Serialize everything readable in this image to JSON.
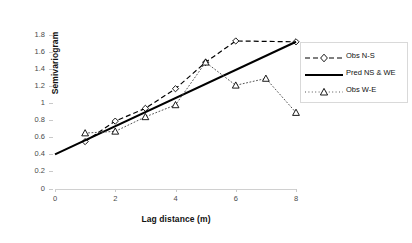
{
  "chart_data": {
    "type": "line",
    "title": "",
    "xlabel": "Lag distance (m)",
    "ylabel": "Semivariogram",
    "xlim": [
      0,
      8
    ],
    "ylim": [
      0,
      1.8
    ],
    "xticks": [
      "0",
      "2",
      "4",
      "6",
      "8"
    ],
    "xtick_values": [
      0,
      2,
      4,
      6,
      8
    ],
    "yticks": [
      "0",
      "0.2",
      "0.4",
      "0.6",
      "0.8",
      "1",
      "1.2",
      "1.4",
      "1.6",
      "1.8"
    ],
    "ytick_values": [
      0,
      0.2,
      0.4,
      0.6,
      0.8,
      1.0,
      1.2,
      1.4,
      1.6,
      1.8
    ],
    "grid": false,
    "legend_position": "right",
    "series": [
      {
        "name": "Obs N-S",
        "style": "dashed",
        "marker": "diamond",
        "color": "#000000",
        "x": [
          1,
          2,
          3,
          4,
          5,
          6,
          8
        ],
        "values": [
          0.55,
          0.79,
          0.94,
          1.17,
          1.48,
          1.73,
          1.72
        ]
      },
      {
        "name": "Pred NS & WE",
        "style": "solid",
        "marker": "none",
        "color": "#000000",
        "x": [
          0,
          8
        ],
        "values": [
          0.4,
          1.72
        ]
      },
      {
        "name": "Obs W-E",
        "style": "dotted",
        "marker": "triangle",
        "color": "#000000",
        "x": [
          1,
          2,
          3,
          4,
          5,
          6,
          7,
          8
        ],
        "values": [
          0.65,
          0.67,
          0.84,
          0.98,
          1.48,
          1.21,
          1.29,
          0.89
        ]
      }
    ]
  },
  "legend": {
    "items": [
      {
        "label": "Obs N-S"
      },
      {
        "label": "Pred NS & WE"
      },
      {
        "label": "Obs W-E"
      }
    ]
  }
}
